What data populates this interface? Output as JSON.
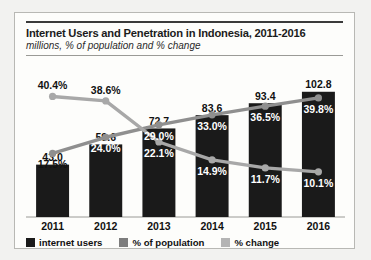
{
  "chart_data": {
    "type": "bar",
    "title": "Internet Users and Penetration in Indonesia, 2011-2016",
    "subtitle": "millions, % of population and % change",
    "xlabel": "",
    "ylabel": "",
    "grid": false,
    "legend_position": "bottom",
    "categories": [
      "2011",
      "2012",
      "2013",
      "2014",
      "2015",
      "2016"
    ],
    "series": [
      {
        "name": "internet users",
        "type": "bar",
        "unit": "millions",
        "color": "#1a1a1a",
        "values": [
          43.0,
          59.6,
          72.7,
          83.6,
          93.4,
          102.8
        ],
        "labels": [
          "43.0",
          "59.6",
          "72.7",
          "83.6",
          "93.4",
          "102.8"
        ]
      },
      {
        "name": "% of population",
        "type": "line",
        "unit": "%",
        "color": "#8f8f8f",
        "values": [
          17.5,
          24.0,
          29.0,
          33.0,
          36.5,
          39.8
        ],
        "labels": [
          "17.5%",
          "24.0%",
          "29.0%",
          "33.0%",
          "36.5%",
          "39.8%"
        ]
      },
      {
        "name": "% change",
        "type": "line",
        "unit": "%",
        "color": "#a8a8a8",
        "values": [
          40.4,
          38.6,
          22.1,
          14.9,
          11.7,
          10.1
        ],
        "labels": [
          "40.4%",
          "38.6%",
          "22.1%",
          "14.9%",
          "11.7%",
          "10.1%"
        ]
      }
    ],
    "ylim_bars": [
      0,
      110
    ],
    "ylim_lines": [
      0,
      45
    ]
  },
  "legend": {
    "items": [
      {
        "label": "internet users",
        "color": "#1a1a1a"
      },
      {
        "label": "% of population",
        "color": "#7d7d7d"
      },
      {
        "label": "% change",
        "color": "#b4b4b4"
      }
    ]
  }
}
